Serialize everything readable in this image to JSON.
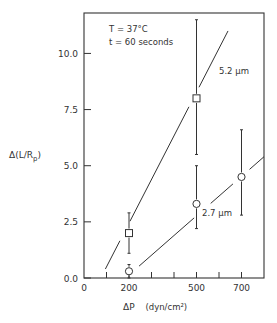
{
  "chart_data": {
    "type": "scatter",
    "title": "",
    "xlabel": "ΔP  (dyn/cm²)",
    "ylabel": "Δ(L/R_p)",
    "xlim": [
      0,
      800
    ],
    "ylim": [
      0,
      11.8
    ],
    "x_ticks": [
      0,
      100,
      200,
      300,
      400,
      500,
      600,
      700
    ],
    "x_tick_labels": [
      "0",
      "",
      "200",
      "",
      "",
      "500",
      "",
      "700"
    ],
    "y_ticks": [
      0.0,
      2.5,
      5.0,
      7.5,
      10.0
    ],
    "y_tick_labels": [
      "0.0",
      "2.5",
      "5.0",
      "7.5",
      "10.0"
    ],
    "grid": false,
    "annotations": [
      {
        "text": "T = 37°C",
        "x": 120,
        "y": 10.8
      },
      {
        "text": "t = 60 seconds",
        "x": 120,
        "y": 10.0
      },
      {
        "text": "5.2 μm",
        "x": 610,
        "y": 9.5
      },
      {
        "text": "2.7 μm",
        "x": 520,
        "y": 3.0
      }
    ],
    "series": [
      {
        "name": "5.2 μm",
        "marker": "square",
        "x": [
          200,
          500
        ],
        "y": [
          2.0,
          8.0
        ],
        "error_low": [
          1.1,
          5.5
        ],
        "error_high": [
          2.9,
          11.5
        ],
        "fit_line": {
          "x": [
            95,
            640
          ],
          "y": [
            0.4,
            11.0
          ]
        }
      },
      {
        "name": "2.7 μm",
        "marker": "circle",
        "x": [
          200,
          500,
          700
        ],
        "y": [
          0.3,
          3.3,
          4.5
        ],
        "error_low": [
          0.0,
          2.2,
          2.8
        ],
        "error_high": [
          0.6,
          5.0,
          6.6
        ],
        "fit_line": {
          "x": [
            190,
            800
          ],
          "y": [
            0.05,
            5.4
          ]
        }
      }
    ]
  },
  "labels": {
    "xlabel_main": "ΔP",
    "xlabel_units": "(dyn/cm²)",
    "ylabel_main": "Δ(L/R",
    "ylabel_sub": "p",
    "ylabel_close": ")",
    "condition_temp": "T = 37°C",
    "condition_time": "t = 60 seconds",
    "series_label_1": "5.2 μm",
    "series_label_2": "2.7 μm"
  },
  "colors": {
    "ink": "#333333",
    "background": "#ffffff"
  }
}
